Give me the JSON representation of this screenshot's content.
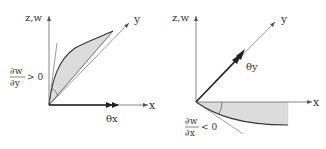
{
  "left_panel": {
    "vertical_axis_label": "z,w",
    "diagonal_axis_label": "y",
    "horizontal_axis_label": "x",
    "rotation_label": "θx",
    "slope_numerator": "∂w",
    "slope_denominator": "∂y",
    "slope_relation": "> 0"
  },
  "right_panel": {
    "vertical_axis_label": "z,w",
    "diagonal_axis_label": "y",
    "horizontal_axis_label": "x",
    "rotation_label": "θy",
    "slope_numerator": "∂w",
    "slope_denominator": "∂x",
    "slope_relation": "< 0"
  },
  "colors": {
    "axis": "#555555",
    "curve": "#333333",
    "fill": "#d9d9d9",
    "vector": "#222222"
  }
}
